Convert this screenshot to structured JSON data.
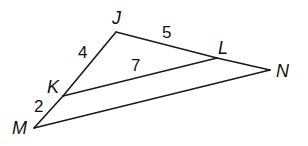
{
  "diagram": {
    "type": "triangle-with-parallel-segment",
    "points": {
      "J": {
        "x": 116,
        "y": 32
      },
      "K": {
        "x": 63,
        "y": 96
      },
      "M": {
        "x": 34,
        "y": 128
      },
      "L": {
        "x": 217,
        "y": 58
      },
      "N": {
        "x": 270,
        "y": 70
      }
    },
    "segments": [
      {
        "name": "JK",
        "from": "J",
        "to": "K"
      },
      {
        "name": "KM",
        "from": "K",
        "to": "M"
      },
      {
        "name": "JL",
        "from": "J",
        "to": "L"
      },
      {
        "name": "LN",
        "from": "L",
        "to": "N"
      },
      {
        "name": "KL",
        "from": "K",
        "to": "L"
      },
      {
        "name": "MN",
        "from": "M",
        "to": "N"
      }
    ],
    "vertex_labels": {
      "J": "J",
      "K": "K",
      "L": "L",
      "M": "M",
      "N": "N"
    },
    "measures": {
      "JK": "4",
      "JL": "5",
      "KL": "7",
      "KM": "2"
    },
    "colors": {
      "line": "#1a1a1a",
      "text": "#111111",
      "background": "#ffffff"
    }
  }
}
